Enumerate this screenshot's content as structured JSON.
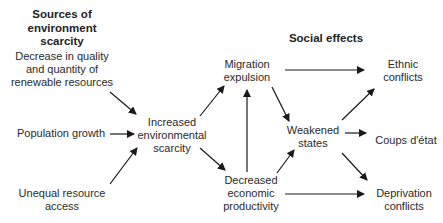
{
  "headings": {
    "sources": [
      "Sources of",
      "environment",
      "scarcity"
    ],
    "social": "Social effects"
  },
  "nodes": {
    "decrease": [
      "Decrease in quality",
      "and quantity of",
      "renewable resources"
    ],
    "population": "Population growth",
    "unequal": [
      "Unequal resource",
      "access"
    ],
    "increased": [
      "Increased",
      "environmental",
      "scarcity"
    ],
    "migration": [
      "Migration",
      "expulsion"
    ],
    "decreased_econ": [
      "Decreased",
      "economic",
      "productivity"
    ],
    "weakened": [
      "Weakened",
      "states"
    ],
    "ethnic": [
      "Ethnic",
      "conflicts"
    ],
    "coups": "Coups d'état",
    "deprivation": [
      "Deprivation",
      "conflicts"
    ]
  },
  "edges": [
    {
      "from": "decrease",
      "to": "increased"
    },
    {
      "from": "population",
      "to": "increased"
    },
    {
      "from": "unequal",
      "to": "increased"
    },
    {
      "from": "increased",
      "to": "migration"
    },
    {
      "from": "increased",
      "to": "decreased_econ"
    },
    {
      "from": "decreased_econ",
      "to": "migration"
    },
    {
      "from": "migration",
      "to": "ethnic"
    },
    {
      "from": "migration",
      "to": "weakened"
    },
    {
      "from": "decreased_econ",
      "to": "weakened"
    },
    {
      "from": "decreased_econ",
      "to": "deprivation"
    },
    {
      "from": "weakened",
      "to": "ethnic"
    },
    {
      "from": "weakened",
      "to": "coups"
    },
    {
      "from": "weakened",
      "to": "deprivation"
    }
  ],
  "colors": {
    "text": "#2a2a2a",
    "arrow": "#1a1a1a",
    "background": "#ffffff"
  }
}
